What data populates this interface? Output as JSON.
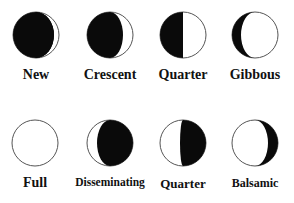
{
  "diagram": {
    "colors": {
      "dark": "#0a0a0a",
      "light": "#ffffff",
      "outline": "#555555",
      "text": "#111111"
    },
    "rows": [
      {
        "phases": [
          {
            "label": "New",
            "cx": 36,
            "shape": "new"
          },
          {
            "label": "Crescent",
            "cx": 110,
            "shape": "crescent"
          },
          {
            "label": "Quarter",
            "cx": 183,
            "shape": "first-quarter"
          },
          {
            "label": "Gibbous",
            "cx": 255,
            "shape": "gibbous"
          }
        ]
      },
      {
        "phases": [
          {
            "label": "Full",
            "cx": 35,
            "shape": "full"
          },
          {
            "label": "Disseminating",
            "cx": 110,
            "shape": "disseminating"
          },
          {
            "label": "Quarter",
            "cx": 183,
            "shape": "last-quarter"
          },
          {
            "label": "Balsamic",
            "cx": 255,
            "shape": "balsamic"
          }
        ]
      }
    ]
  }
}
